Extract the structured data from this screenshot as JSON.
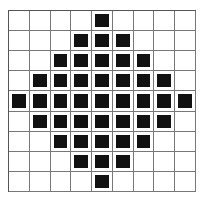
{
  "grid": {
    "rows": 9,
    "cols": 9,
    "fill_color": "#111111",
    "line_color": "#777777",
    "pattern": [
      [
        0,
        0,
        0,
        0,
        1,
        0,
        0,
        0,
        0
      ],
      [
        0,
        0,
        0,
        1,
        1,
        1,
        0,
        0,
        0
      ],
      [
        0,
        0,
        1,
        1,
        1,
        1,
        1,
        0,
        0
      ],
      [
        0,
        1,
        1,
        1,
        1,
        1,
        1,
        1,
        0
      ],
      [
        1,
        1,
        1,
        1,
        1,
        1,
        1,
        1,
        1
      ],
      [
        0,
        1,
        1,
        1,
        1,
        1,
        1,
        1,
        0
      ],
      [
        0,
        0,
        1,
        1,
        1,
        1,
        1,
        0,
        0
      ],
      [
        0,
        0,
        0,
        1,
        1,
        1,
        0,
        0,
        0
      ],
      [
        0,
        0,
        0,
        0,
        1,
        0,
        0,
        0,
        0
      ]
    ]
  }
}
